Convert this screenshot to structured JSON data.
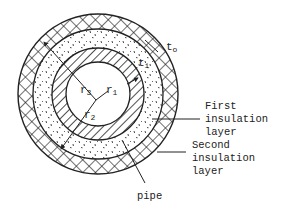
{
  "diagram": {
    "geometry": {
      "center": [
        98,
        94
      ],
      "radii": {
        "outer_second_insulation": 80,
        "inner_second_insulation": 65,
        "outer_pipe": 46,
        "inner_pipe": 32
      }
    },
    "symbols": {
      "r1": {
        "base": "r",
        "sub": "1"
      },
      "r2": {
        "base": "r",
        "sub": "2"
      },
      "r3": {
        "base": "r",
        "sub": "3"
      },
      "ti": {
        "base": "t",
        "sub": "i"
      },
      "to": {
        "base": "t",
        "sub": "o"
      }
    },
    "labels": {
      "first_insulation": [
        "First",
        "insulation",
        "layer"
      ],
      "second_insulation": [
        "Second",
        "insulation",
        "layer"
      ],
      "pipe": "pipe"
    },
    "colors": {
      "ink": "#222222",
      "background": "#ffffff"
    }
  }
}
